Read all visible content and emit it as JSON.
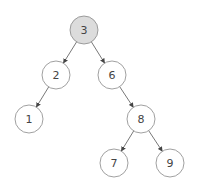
{
  "diagram": {
    "type": "binary-search-tree",
    "highlight_color": "#dcdcdc",
    "node_fill": "#ffffff",
    "nodes": [
      {
        "id": "n3",
        "label": "3",
        "x": 84,
        "y": 30,
        "highlighted": true
      },
      {
        "id": "n2",
        "label": "2",
        "x": 56,
        "y": 75,
        "highlighted": false
      },
      {
        "id": "n6",
        "label": "6",
        "x": 112,
        "y": 75,
        "highlighted": false
      },
      {
        "id": "n1",
        "label": "1",
        "x": 29,
        "y": 119,
        "highlighted": false
      },
      {
        "id": "n8",
        "label": "8",
        "x": 141,
        "y": 119,
        "highlighted": false
      },
      {
        "id": "n7",
        "label": "7",
        "x": 114,
        "y": 163,
        "highlighted": false
      },
      {
        "id": "n9",
        "label": "9",
        "x": 170,
        "y": 163,
        "highlighted": false
      }
    ],
    "edges": [
      {
        "from": "n3",
        "to": "n2"
      },
      {
        "from": "n3",
        "to": "n6"
      },
      {
        "from": "n2",
        "to": "n1"
      },
      {
        "from": "n6",
        "to": "n8"
      },
      {
        "from": "n8",
        "to": "n7"
      },
      {
        "from": "n8",
        "to": "n9"
      }
    ]
  }
}
